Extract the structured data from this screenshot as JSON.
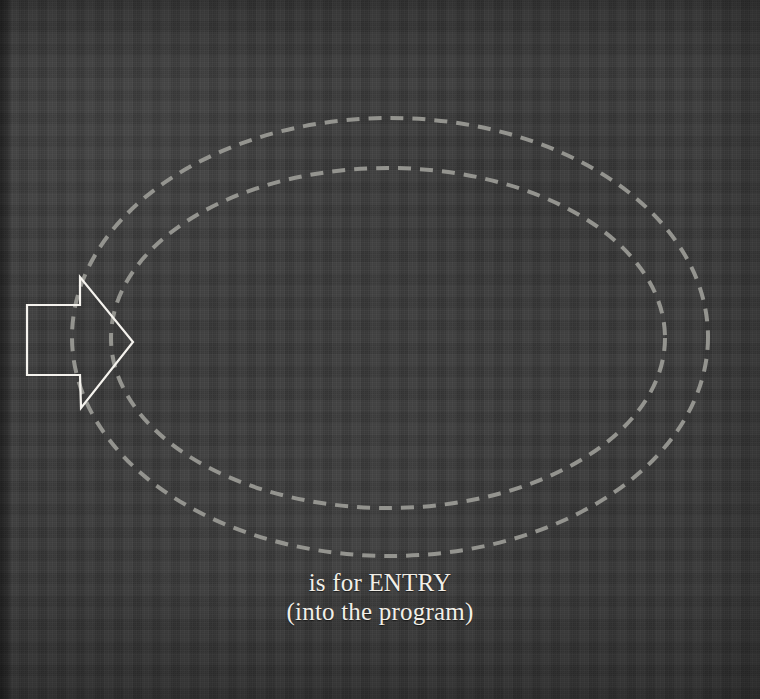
{
  "plate": {
    "title": "is for ENTRY",
    "background_color": "#3b3b3b",
    "width": 760,
    "height": 699
  },
  "caption": {
    "line1": "is for ENTRY",
    "line2": "(into the program)",
    "color": "#f2efe8"
  },
  "diagram": {
    "arrow": {
      "name": "entry-arrow",
      "direction": "right",
      "style": "outline",
      "stroke_color": "#f5f3ee",
      "fill": "none",
      "stroke_width": 2.2,
      "points": "27,305 80,305 80,277 133,342 81,408 80,375 27,375",
      "tip_x": 133,
      "tip_y": 342
    },
    "outer_ellipse": {
      "name": "outer-boundary-ellipse",
      "cx": 390,
      "cy": 337,
      "rx": 318,
      "ry": 219,
      "stroke_color": "#9b9b96",
      "stroke_width": 4,
      "dash": "13 9",
      "fill": "none"
    },
    "inner_ellipse": {
      "name": "inner-boundary-ellipse",
      "cx": 388,
      "cy": 338,
      "rx": 277,
      "ry": 170,
      "stroke_color": "#9b9b96",
      "stroke_width": 4,
      "dash": "13 9",
      "fill": "none"
    }
  }
}
